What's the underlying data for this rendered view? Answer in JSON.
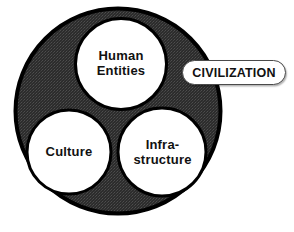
{
  "diagram": {
    "type": "venn-cluster",
    "callout": {
      "label": "CIVILIZATION",
      "shape": "rounded-pill",
      "fill_color": "#ffffff",
      "border_color": "#4a4a4a",
      "text_color": "#111111"
    },
    "outer_circle": {
      "name": "civilization-container",
      "fill_color": "#333333",
      "texture": "halftone-dither",
      "outline_color": "#000000",
      "center_x": 118,
      "center_y": 111,
      "radius": 104
    },
    "inner_circles": [
      {
        "name": "human-entities",
        "label": "Human\nEntities",
        "fill_color": "#ffffff",
        "outline_color": "#000000",
        "center_x": 121,
        "center_y": 64,
        "radius": 47
      },
      {
        "name": "culture",
        "label": "Culture",
        "fill_color": "#ffffff",
        "outline_color": "#000000",
        "center_x": 69,
        "center_y": 152,
        "radius": 43.5
      },
      {
        "name": "infrastructure",
        "label": "Infra-\nstructure",
        "fill_color": "#ffffff",
        "outline_color": "#000000",
        "center_x": 162,
        "center_y": 152,
        "radius": 45.5
      }
    ]
  }
}
